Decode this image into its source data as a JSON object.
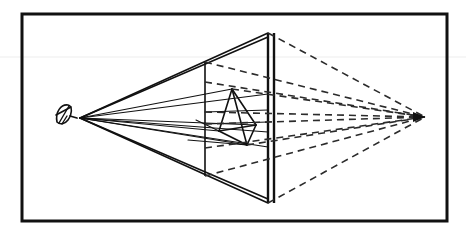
{
  "figure": {
    "canvas": {
      "width": 466,
      "height": 232
    },
    "colors": {
      "background": "#ffffff",
      "ink": "#111111",
      "ink_light": "#3a3a3a",
      "dashed": "#2b2b2b",
      "scanline": "#e8e8e8"
    },
    "stroke_widths": {
      "frame": 3.0,
      "solid_ray": 1.1,
      "solid_edge": 1.6,
      "plane_edge": 2.4,
      "dashed": 1.6,
      "scanline": 0.8
    },
    "dash_pattern": "7 5"
  },
  "frame": {
    "label": "outer-border",
    "x": 22,
    "y": 14,
    "width": 425,
    "height": 207
  },
  "scanline": {
    "label": "faint horizontal scan artifact",
    "y": 57,
    "x1": 0,
    "x2": 466
  },
  "eye": {
    "label": "eye / station point",
    "cx": 64,
    "cy": 114,
    "station_point": {
      "x": 80,
      "y": 118
    },
    "glyph": "eye-symbol"
  },
  "picture_plane": {
    "label": "picture plane (vertical double line)",
    "x_front": 268,
    "x_front_2": 274,
    "top_y": 33,
    "bottom_y": 203,
    "near_plane_x": 205,
    "near_plane_top_y": 62,
    "near_plane_bottom_y": 176
  },
  "cone_of_vision": {
    "label": "solid visual cone from eye to plane corners",
    "apex": {
      "x": 80,
      "y": 118
    },
    "corners": [
      {
        "x": 268,
        "y": 33
      },
      {
        "x": 268,
        "y": 203
      }
    ],
    "double_edge_offset": 4
  },
  "vanishing_point": {
    "label": "vanishing point",
    "x": 425,
    "y": 117
  },
  "tetrahedron": {
    "label": "tetrahedron object",
    "vertices": {
      "apex": {
        "x": 232,
        "y": 89
      },
      "left_base": {
        "x": 219,
        "y": 131
      },
      "front_base": {
        "x": 247,
        "y": 145
      },
      "right_base": {
        "x": 256,
        "y": 125
      }
    },
    "edges": [
      [
        "apex",
        "left_base"
      ],
      [
        "apex",
        "front_base"
      ],
      [
        "apex",
        "right_base"
      ],
      [
        "left_base",
        "front_base"
      ],
      [
        "front_base",
        "right_base"
      ],
      [
        "left_base",
        "right_base"
      ]
    ]
  },
  "sight_rays": {
    "label": "solid rays from eye through object",
    "lines": [
      {
        "x1": 80,
        "y1": 118,
        "x2": 232,
        "y2": 89
      },
      {
        "x1": 80,
        "y1": 118,
        "x2": 256,
        "y2": 125
      },
      {
        "x1": 80,
        "y1": 118,
        "x2": 247,
        "y2": 145
      },
      {
        "x1": 80,
        "y1": 118,
        "x2": 219,
        "y2": 131
      },
      {
        "x1": 80,
        "y1": 118,
        "x2": 268,
        "y2": 94
      },
      {
        "x1": 80,
        "y1": 118,
        "x2": 268,
        "y2": 132
      },
      {
        "x1": 80,
        "y1": 118,
        "x2": 268,
        "y2": 147
      }
    ]
  },
  "projection_lines": {
    "label": "dashed lines converging on vanishing point",
    "lines": [
      {
        "x1": 268,
        "y1": 33,
        "x2": 425,
        "y2": 117
      },
      {
        "x1": 205,
        "y1": 62,
        "x2": 425,
        "y2": 117
      },
      {
        "x1": 205,
        "y1": 82,
        "x2": 425,
        "y2": 117
      },
      {
        "x1": 205,
        "y1": 112,
        "x2": 425,
        "y2": 117
      },
      {
        "x1": 205,
        "y1": 124,
        "x2": 425,
        "y2": 117
      },
      {
        "x1": 205,
        "y1": 148,
        "x2": 425,
        "y2": 117
      },
      {
        "x1": 205,
        "y1": 176,
        "x2": 425,
        "y2": 117
      },
      {
        "x1": 268,
        "y1": 203,
        "x2": 425,
        "y2": 117
      },
      {
        "x1": 232,
        "y1": 89,
        "x2": 425,
        "y2": 117
      },
      {
        "x1": 247,
        "y1": 145,
        "x2": 425,
        "y2": 117
      }
    ]
  },
  "base_lines": {
    "label": "solid construction lines near base of cone",
    "lines": [
      {
        "x1": 205,
        "y1": 112,
        "x2": 268,
        "y2": 110
      },
      {
        "x1": 205,
        "y1": 124,
        "x2": 268,
        "y2": 122
      },
      {
        "x1": 188,
        "y1": 140,
        "x2": 247,
        "y2": 145
      },
      {
        "x1": 196,
        "y1": 120,
        "x2": 219,
        "y2": 131
      }
    ]
  }
}
